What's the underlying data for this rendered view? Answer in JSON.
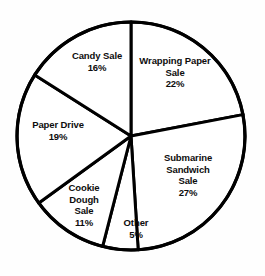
{
  "chart_data": {
    "type": "pie",
    "title": "",
    "subtitle": "",
    "xlabel": "",
    "ylabel": "",
    "legend_position": "none",
    "grid": false,
    "value_unit": "%",
    "start_angle_deg": 0,
    "direction": "clockwise",
    "total": 100,
    "categories": [
      "Wrapping Paper Sale",
      "Submarine Sandwich Sale",
      "Other",
      "Cookie Dough Sale",
      "Paper Drive",
      "Candy Sale"
    ],
    "values": [
      22,
      27,
      5,
      11,
      19,
      16
    ],
    "slices": [
      {
        "name": "wrapping-paper-sale",
        "lines": [
          "Wrapping Paper",
          "Sale"
        ],
        "value": 22,
        "value_label": "22%",
        "start_deg": 0,
        "end_deg": 79.2,
        "label_x": 175,
        "label_y": 72
      },
      {
        "name": "submarine-sandwich-sale",
        "lines": [
          "Submarine",
          "Sandwich",
          "Sale"
        ],
        "value": 27,
        "value_label": "27%",
        "start_deg": 79.2,
        "end_deg": 176.4,
        "label_x": 188,
        "label_y": 175
      },
      {
        "name": "other",
        "lines": [
          "Other"
        ],
        "value": 5,
        "value_label": "5%",
        "start_deg": 176.4,
        "end_deg": 194.4,
        "label_x": 136,
        "label_y": 228
      },
      {
        "name": "cookie-dough-sale",
        "lines": [
          "Cookie",
          "Dough",
          "Sale"
        ],
        "value": 11,
        "value_label": "11%",
        "start_deg": 194.4,
        "end_deg": 234.0,
        "label_x": 84,
        "label_y": 205
      },
      {
        "name": "paper-drive",
        "lines": [
          "Paper Drive"
        ],
        "value": 19,
        "value_label": "19%",
        "start_deg": 234.0,
        "end_deg": 302.4,
        "label_x": 58,
        "label_y": 130
      },
      {
        "name": "candy-sale",
        "lines": [
          "Candy Sale"
        ],
        "value": 16,
        "value_label": "16%",
        "start_deg": 302.4,
        "end_deg": 360,
        "label_x": 97,
        "label_y": 61
      }
    ],
    "geometry": {
      "center_x": 131,
      "center_y": 136,
      "radius": 114
    },
    "colors": {
      "slice_fill": "#ffffff",
      "stroke": "#000000",
      "label_text": "#0d0d0d",
      "background": "#fefefe"
    }
  }
}
